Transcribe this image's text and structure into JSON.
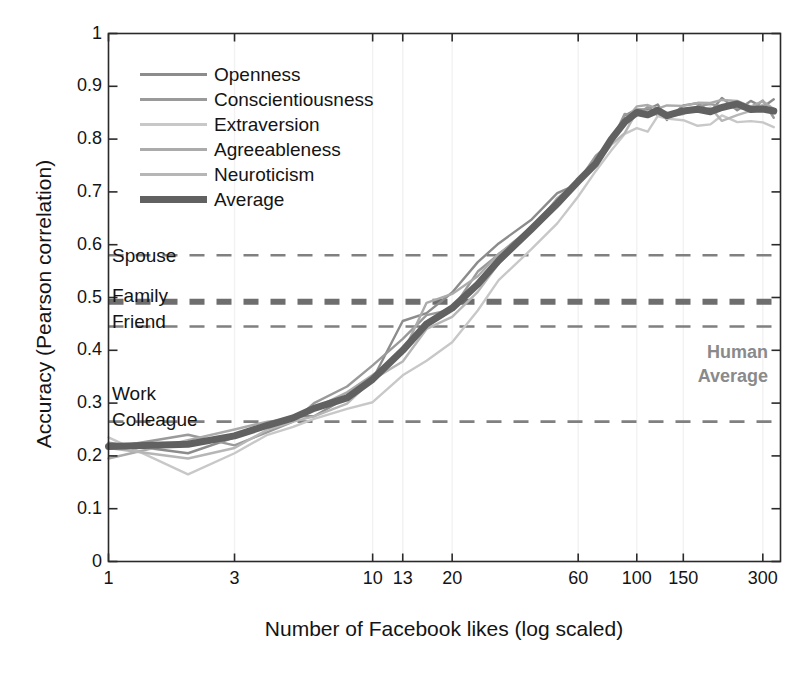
{
  "chart_data": {
    "type": "line",
    "title": "",
    "xlabel": "Number of Facebook likes (log scaled)",
    "ylabel": "Accuracy (Pearson correlation)",
    "xscale": "log",
    "xlim": [
      1,
      350
    ],
    "ylim": [
      0,
      1
    ],
    "grid": "faint-vertical",
    "legend_position": "upper-left-inside",
    "xticks": [
      {
        "value": 1,
        "label": "1"
      },
      {
        "value": 3,
        "label": "3"
      },
      {
        "value": 10,
        "label": "10"
      },
      {
        "value": 13,
        "label": "13"
      },
      {
        "value": 20,
        "label": "20"
      },
      {
        "value": 60,
        "label": "60"
      },
      {
        "value": 100,
        "label": "100"
      },
      {
        "value": 150,
        "label": "150"
      },
      {
        "value": 300,
        "label": "300"
      }
    ],
    "yticks": [
      {
        "value": 0,
        "label": "0"
      },
      {
        "value": 0.1,
        "label": "0.1"
      },
      {
        "value": 0.2,
        "label": "0.2"
      },
      {
        "value": 0.3,
        "label": "0.3"
      },
      {
        "value": 0.4,
        "label": "0.4"
      },
      {
        "value": 0.5,
        "label": "0.5"
      },
      {
        "value": 0.6,
        "label": "0.6"
      },
      {
        "value": 0.7,
        "label": "0.7"
      },
      {
        "value": 0.8,
        "label": "0.8"
      },
      {
        "value": 0.9,
        "label": "0.9"
      },
      {
        "value": 1,
        "label": "1"
      }
    ],
    "x": [
      1,
      2,
      3,
      4,
      5,
      6,
      8,
      10,
      13,
      16,
      20,
      25,
      30,
      40,
      50,
      60,
      70,
      80,
      90,
      100,
      110,
      120,
      130,
      150,
      170,
      190,
      210,
      240,
      270,
      300,
      330
    ],
    "series": [
      {
        "name": "Openness",
        "color": "#8c8c8c",
        "width": 2.4,
        "values": [
          0.225,
          0.205,
          0.235,
          0.255,
          0.275,
          0.275,
          0.305,
          0.345,
          0.455,
          0.47,
          0.52,
          0.565,
          0.6,
          0.65,
          0.69,
          0.72,
          0.76,
          0.8,
          0.83,
          0.85,
          0.845,
          0.855,
          0.85,
          0.86,
          0.855,
          0.86,
          0.87,
          0.865,
          0.86,
          0.87,
          0.88
        ]
      },
      {
        "name": "Conscientiousness",
        "color": "#9a9a9a",
        "width": 2.4,
        "values": [
          0.215,
          0.24,
          0.22,
          0.245,
          0.265,
          0.3,
          0.33,
          0.37,
          0.42,
          0.465,
          0.48,
          0.54,
          0.575,
          0.64,
          0.68,
          0.715,
          0.755,
          0.795,
          0.835,
          0.845,
          0.86,
          0.845,
          0.855,
          0.86,
          0.865,
          0.855,
          0.86,
          0.87,
          0.855,
          0.865,
          0.855
        ]
      },
      {
        "name": "Extraversion",
        "color": "#c8c8c8",
        "width": 2.4,
        "values": [
          0.235,
          0.165,
          0.205,
          0.24,
          0.255,
          0.27,
          0.285,
          0.31,
          0.345,
          0.39,
          0.42,
          0.47,
          0.53,
          0.6,
          0.65,
          0.7,
          0.74,
          0.78,
          0.82,
          0.835,
          0.825,
          0.84,
          0.83,
          0.845,
          0.835,
          0.84,
          0.83,
          0.845,
          0.825,
          0.835,
          0.815
        ]
      },
      {
        "name": "Agreeableness",
        "color": "#ababab",
        "width": 2.4,
        "values": [
          0.195,
          0.23,
          0.25,
          0.265,
          0.27,
          0.29,
          0.31,
          0.355,
          0.405,
          0.49,
          0.505,
          0.535,
          0.58,
          0.635,
          0.69,
          0.725,
          0.765,
          0.8,
          0.84,
          0.85,
          0.855,
          0.86,
          0.85,
          0.865,
          0.86,
          0.87,
          0.86,
          0.875,
          0.86,
          0.87,
          0.865
        ]
      },
      {
        "name": "Neuroticism",
        "color": "#b6b6b6",
        "width": 2.4,
        "values": [
          0.215,
          0.195,
          0.215,
          0.25,
          0.265,
          0.275,
          0.295,
          0.335,
          0.375,
          0.43,
          0.455,
          0.51,
          0.555,
          0.625,
          0.675,
          0.71,
          0.75,
          0.79,
          0.825,
          0.84,
          0.83,
          0.845,
          0.84,
          0.85,
          0.845,
          0.85,
          0.84,
          0.855,
          0.84,
          0.85,
          0.845
        ]
      },
      {
        "name": "Average",
        "color": "#616161",
        "width": 7,
        "values": [
          0.218,
          0.222,
          0.238,
          0.258,
          0.272,
          0.29,
          0.31,
          0.345,
          0.4,
          0.45,
          0.48,
          0.525,
          0.57,
          0.63,
          0.678,
          0.716,
          0.756,
          0.795,
          0.83,
          0.845,
          0.845,
          0.85,
          0.848,
          0.857,
          0.855,
          0.857,
          0.855,
          0.863,
          0.852,
          0.86,
          0.855
        ]
      }
    ],
    "reference_lines": [
      {
        "label": "Spouse",
        "value": 0.58,
        "color": "#808080",
        "width": 2.6
      },
      {
        "label": "Family",
        "value": 0.492,
        "color": "#6e6e6e",
        "width": 6
      },
      {
        "label": "Friend",
        "value": 0.445,
        "color": "#808080",
        "width": 2.6
      },
      {
        "label": "Work Colleague",
        "value": 0.265,
        "color": "#808080",
        "width": 2.6
      }
    ],
    "annotations": [
      {
        "name": "human-average",
        "line1": "Human",
        "line2": "Average",
        "color": "#8a8a8a"
      }
    ]
  },
  "ref_labels": {
    "spouse": "Spouse",
    "family": "Family",
    "friend": "Friend",
    "work": "Work",
    "colleague": "Colleague"
  },
  "annotation": {
    "human": "Human",
    "average": "Average"
  }
}
